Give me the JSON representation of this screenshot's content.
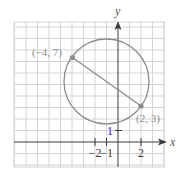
{
  "figure": {
    "type": "coordinate-plane",
    "axes": {
      "x_label": "x",
      "y_label": "y",
      "x_ticks": [
        {
          "value": -2,
          "label": "−2"
        },
        {
          "value": -1,
          "label": "−1"
        },
        {
          "value": 2,
          "label": "2"
        }
      ],
      "y_ticks": [
        {
          "value": 1,
          "label": "1"
        }
      ]
    },
    "grid": {
      "x_range": [
        -9,
        4
      ],
      "y_range": [
        -2,
        10.5
      ],
      "step": 1
    },
    "circle": {
      "center": [
        -1,
        5
      ],
      "radius": 3.606
    },
    "segment": {
      "from": [
        -4,
        7
      ],
      "to": [
        2,
        3
      ]
    },
    "points": [
      {
        "x": -4,
        "y": 7,
        "label": "(−4, 7)"
      },
      {
        "x": 2,
        "y": 3,
        "label": "(2, 3)"
      }
    ],
    "colors": {
      "grid": "#d4d4d4",
      "axis": "#3a3a3a",
      "curve": "#8c8c8c",
      "point": "#8c8c8c",
      "label": "#8a8a8a"
    }
  }
}
